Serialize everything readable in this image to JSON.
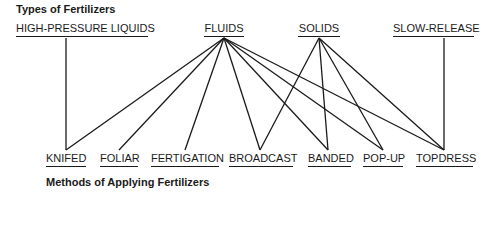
{
  "top_title": "Types of Fertilizers",
  "bottom_title": "Methods of Applying Fertilizers",
  "types": [
    {
      "id": "hpl",
      "label": "HIGH-PRESSURE LIQUIDS",
      "x": 16,
      "w": 132,
      "cx": 66
    },
    {
      "id": "fluids",
      "label": "FLUIDS",
      "x": 204,
      "w": 40,
      "cx": 224
    },
    {
      "id": "solids",
      "label": "SOLIDS",
      "x": 298,
      "w": 42,
      "cx": 319
    },
    {
      "id": "slow",
      "label": "SLOW-RELEASE",
      "x": 393,
      "w": 81,
      "cx": 444
    }
  ],
  "methods": [
    {
      "id": "knifed",
      "label": "KNIFED",
      "x": 46,
      "w": 40,
      "cx": 66
    },
    {
      "id": "foliar",
      "label": "FOLIAR",
      "x": 100,
      "w": 38,
      "cx": 119
    },
    {
      "id": "fertigation",
      "label": "FERTIGATION",
      "x": 151,
      "w": 68,
      "cx": 185
    },
    {
      "id": "broadcast",
      "label": "BROADCAST",
      "x": 229,
      "w": 64,
      "cx": 260
    },
    {
      "id": "banded",
      "label": "BANDED",
      "x": 308,
      "w": 43,
      "cx": 328
    },
    {
      "id": "popup",
      "label": "POP-UP",
      "x": 363,
      "w": 40,
      "cx": 383
    },
    {
      "id": "topdress",
      "label": "TOPDRESS",
      "x": 416,
      "w": 57,
      "cx": 444
    }
  ],
  "links": [
    [
      "hpl",
      "knifed"
    ],
    [
      "fluids",
      "knifed"
    ],
    [
      "fluids",
      "foliar"
    ],
    [
      "fluids",
      "fertigation"
    ],
    [
      "fluids",
      "broadcast"
    ],
    [
      "fluids",
      "banded"
    ],
    [
      "fluids",
      "popup"
    ],
    [
      "fluids",
      "topdress"
    ],
    [
      "solids",
      "broadcast"
    ],
    [
      "solids",
      "banded"
    ],
    [
      "solids",
      "popup"
    ],
    [
      "solids",
      "topdress"
    ],
    [
      "slow",
      "topdress"
    ]
  ]
}
